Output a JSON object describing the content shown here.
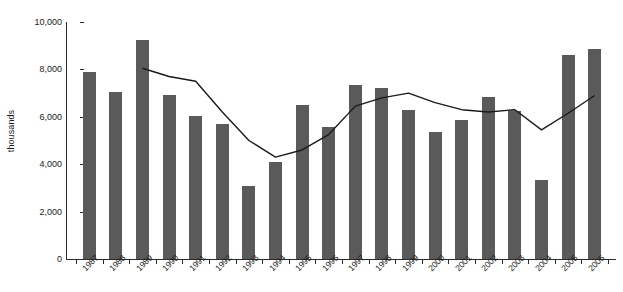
{
  "chart_data": {
    "type": "bar",
    "title": "",
    "xlabel": "",
    "ylabel": "thousands",
    "ylim": [
      0,
      10000
    ],
    "yticks": [
      0,
      2000,
      4000,
      6000,
      8000,
      10000
    ],
    "ytick_labels": [
      "0",
      "2,000",
      "4,000",
      "6,000",
      "8,000",
      "10,000"
    ],
    "grid": false,
    "legend": "none",
    "categories": [
      "1987",
      "1988",
      "1989",
      "1990",
      "1991",
      "1992",
      "1993",
      "1994",
      "1995",
      "1996",
      "1997",
      "1998",
      "1999",
      "2000",
      "2001",
      "2002",
      "2003",
      "2004",
      "2005",
      "2006"
    ],
    "series": [
      {
        "name": "bars",
        "type": "bar",
        "color": "#5a5a5a",
        "values": [
          7900,
          7050,
          9250,
          6900,
          6050,
          5700,
          3100,
          4100,
          6500,
          5550,
          7350,
          7200,
          6300,
          5350,
          5850,
          6850,
          6250,
          3350,
          8600,
          8850
        ]
      },
      {
        "name": "line",
        "type": "line",
        "color": "#1a1a1a",
        "x": [
          "1989",
          "1990",
          "1991",
          "1992",
          "1993",
          "1994",
          "1995",
          "1996",
          "1997",
          "1998",
          "1999",
          "2000",
          "2001",
          "2002",
          "2003",
          "2004",
          "2005",
          "2006"
        ],
        "values": [
          8050,
          7700,
          7500,
          6200,
          5000,
          4300,
          4600,
          5250,
          6450,
          6800,
          7000,
          6600,
          6300,
          6200,
          6300,
          5450,
          6150,
          6900
        ]
      }
    ]
  },
  "axis": {
    "y_title": "thousands"
  }
}
